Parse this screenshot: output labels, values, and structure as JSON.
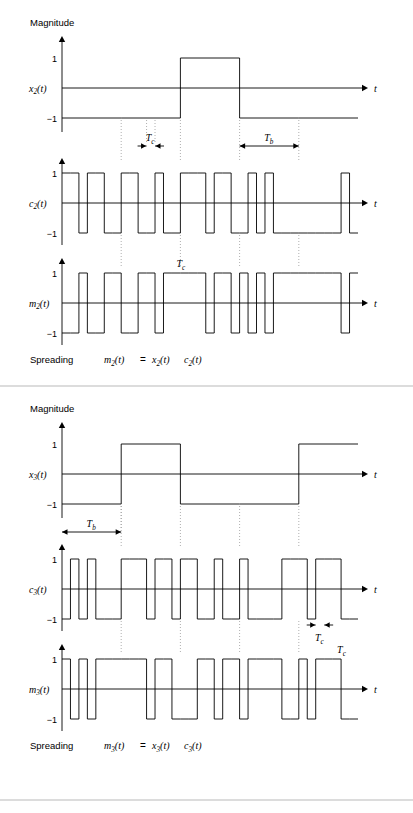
{
  "figure": {
    "axis_label_magnitude": "Magnitude",
    "axis_label_time": "t",
    "tick_pos": "1",
    "tick_neg": "−1",
    "stroke_color": "#000000",
    "guide_color": "#9a9a9a",
    "rule_color": "#b9b9b9"
  },
  "groups": [
    {
      "id": "group-2",
      "magnitude_label": "Magnitude",
      "spreading_label": "Spreading",
      "equation": "m2(t) = x2(t) c2(t)",
      "equation_parts": {
        "m": "m",
        "m_sub": "2",
        "x": "x",
        "x_sub": "2",
        "c": "c",
        "c_sub": "2",
        "oft": "(t)",
        "eq": "="
      },
      "markers": [
        {
          "name": "Tc",
          "symbol": "T",
          "sub": "c"
        },
        {
          "name": "Tb",
          "symbol": "T",
          "sub": "b"
        }
      ],
      "panels": [
        {
          "id": "x2",
          "label": "x",
          "label_sub": "2",
          "label_suffix": "(t)",
          "kind": "data",
          "bits": [
            -1,
            -1,
            1,
            -1,
            -1
          ],
          "chips_per_bit": 7
        },
        {
          "id": "c2",
          "label": "c",
          "label_sub": "2",
          "label_suffix": "(t)",
          "kind": "code",
          "chips": [
            1,
            1,
            -1,
            1,
            1,
            -1,
            -1,
            1,
            1,
            -1,
            -1,
            1,
            -1,
            -1,
            1,
            1,
            1,
            -1,
            1,
            1,
            -1,
            -1,
            1,
            -1,
            1,
            -1,
            -1,
            -1,
            -1,
            -1,
            -1,
            -1,
            -1,
            1,
            -1
          ]
        },
        {
          "id": "m2",
          "label": "m",
          "label_sub": "2",
          "label_suffix": "(t)",
          "kind": "product",
          "of": [
            "x2",
            "c2"
          ],
          "tc_annotation": {
            "symbol": "T",
            "sub": "c",
            "at_chip": 14
          }
        }
      ]
    },
    {
      "id": "group-3",
      "magnitude_label": "Magnitude",
      "spreading_label": "Spreading",
      "equation": "m3(t) = x3(t) c3(t)",
      "equation_parts": {
        "m": "m",
        "m_sub": "3",
        "x": "x",
        "x_sub": "3",
        "c": "c",
        "c_sub": "3",
        "oft": "(t)",
        "eq": "="
      },
      "markers": [
        {
          "name": "Tb",
          "symbol": "T",
          "sub": "b"
        },
        {
          "name": "Tc",
          "symbol": "T",
          "sub": "c"
        },
        {
          "name": "Tc2",
          "symbol": "T",
          "sub": "c"
        }
      ],
      "panels": [
        {
          "id": "x3",
          "label": "x",
          "label_sub": "3",
          "label_suffix": "(t)",
          "kind": "data",
          "bits": [
            -1,
            1,
            -1,
            -1,
            1
          ],
          "chips_per_bit": 7
        },
        {
          "id": "c3",
          "label": "c",
          "label_sub": "3",
          "label_suffix": "(t)",
          "kind": "code",
          "chips": [
            -1,
            1,
            -1,
            1,
            -1,
            -1,
            -1,
            1,
            1,
            1,
            -1,
            1,
            1,
            -1,
            1,
            1,
            -1,
            -1,
            1,
            -1,
            -1,
            1,
            -1,
            -1,
            -1,
            -1,
            1,
            1,
            1,
            -1,
            1,
            1,
            1,
            -1,
            -1
          ]
        },
        {
          "id": "m3",
          "label": "m",
          "label_sub": "3",
          "label_suffix": "(t)",
          "kind": "product",
          "of": [
            "x3",
            "c3"
          ],
          "tc_annotation": {
            "symbol": "T",
            "sub": "c",
            "at_chip": 33
          }
        }
      ]
    }
  ]
}
